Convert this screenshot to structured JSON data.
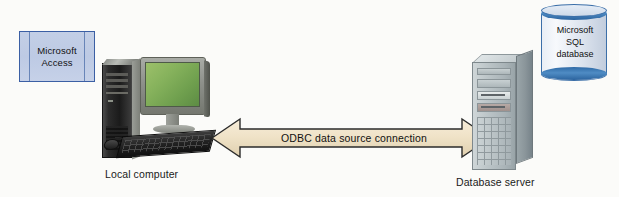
{
  "diagram": {
    "background_color": "#fbfbf9",
    "nodes": {
      "access_box": {
        "label_line1": "Microsoft",
        "label_line2": "Access",
        "fill_color": "#c3cfe6",
        "border_color": "#3b5fa4",
        "shape": "rectangle"
      },
      "local_computer": {
        "caption": "Local computer",
        "icon": "desktop-computer-icon",
        "screen_color": "#86b25c",
        "tower_color": "#1b1b1b"
      },
      "database_server": {
        "caption": "Database server",
        "icon": "server-tower-icon",
        "body_color": "#bcc5c8"
      },
      "sql_database": {
        "label_line1": "Microsoft",
        "label_line2": "SQL",
        "label_line3": "database",
        "shape": "cylinder",
        "band_color": "#2f6aa6",
        "body_color": "#eef2f8"
      }
    },
    "connector": {
      "label": "ODBC data source connection",
      "type": "double-headed-arrow",
      "fill_color": "#f0e3c8",
      "border_color": "#2b2b2b"
    }
  }
}
